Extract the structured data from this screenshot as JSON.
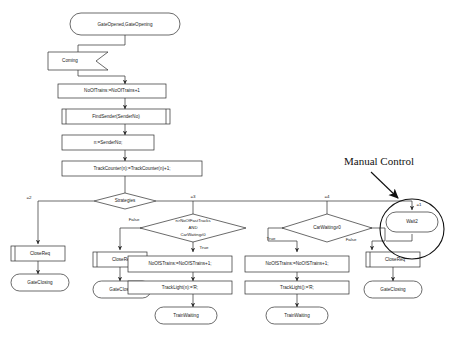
{
  "diagram": {
    "annotation": {
      "label": "Manual Control"
    },
    "nodes": {
      "start_state": "GateOpened,GateOpening",
      "input_coming": "Coming",
      "task_noOfTrains": "NoOfTrains:=NoOfTrains+1",
      "proc_findSender": "FindSender(SenderNo)",
      "task_n_assign": "n:=SenderNo;",
      "task_trackCounter": "TrackCounter(n):=TrackCounter(n)+1;",
      "decision_strategies": "Strategies",
      "decision_fasttracks": "n>NoOfFastTracks AND CarWaiting≠0",
      "decision_fasttracks_line1": "n>NoOfFastTracks",
      "decision_fasttracks_line2": "AND",
      "decision_fasttracks_line3": "CarWaiting≠0",
      "decision_carwaiting": "CarWaiting≠0",
      "state_wait2": "Wait2",
      "out_closereq_1": "CloseReq",
      "state_gateclosing_1": "GateClosing",
      "out_closereq_2": "CloseReq",
      "state_gateclosing_2": "GateClosing",
      "out_closereq_3": "CloseReq",
      "state_gateclosing_3": "GateClosing",
      "task_noOfSTrains_1": "NoOfSTrains:=NoOfSTrains+1;",
      "task_trackLight_1": "TrackLight(n):='R;",
      "state_trainwaiting_1": "TrainWaiting",
      "task_noOfSTrains_2": "NoOfSTrains:=NoOfSTrains+1;",
      "task_trackLight_2": "TrackLight():='R;",
      "state_trainwaiting_2": "TrainWaiting"
    },
    "edge_labels": {
      "strategies_eq2": "=2",
      "strategies_eq3": "=3",
      "strategies_eq4": "=4",
      "strategies_eq1": "=1",
      "fasttracks_false": "False",
      "fasttracks_true": "True",
      "carwaiting_true": "True",
      "carwaiting_false": "False"
    },
    "colors": {
      "stroke": "#2b2b2b",
      "fill": "#ffffff",
      "text": "#1a1a1a",
      "annotation": "#111111"
    }
  }
}
